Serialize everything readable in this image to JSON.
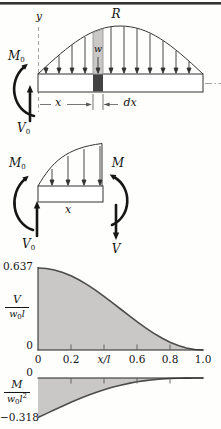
{
  "figure": {
    "top_diagram": {
      "axis_label": "y",
      "resultant_label": "R",
      "load_intensity_label": "w",
      "left_moment": {
        "base": "M",
        "sub": "0"
      },
      "left_shear": {
        "base": "V",
        "sub": "0"
      },
      "x_dim_label": "x",
      "dx_dim_label": "dx"
    },
    "fbd_diagram": {
      "left_moment": {
        "base": "M",
        "sub": "0"
      },
      "left_shear": {
        "base": "V",
        "sub": "0"
      },
      "right_moment": "M",
      "right_shear": "V",
      "x_dim_label": "x"
    }
  },
  "chart_data": [
    {
      "type": "area",
      "name": "shear",
      "title": "",
      "xlabel": "x/l",
      "ylabel": "V/w0l",
      "ylabel_frac": {
        "num": "V",
        "den_base": "w",
        "den_sub": "0",
        "den_rest": "l"
      },
      "y_top_label": "0.637",
      "y_zero_label": "0",
      "x_tick_labels": [
        "0",
        "0.2",
        "x/l",
        "0.6",
        "0.8",
        "1.0"
      ],
      "x_ticks": [
        0.2,
        0.4,
        0.6,
        0.8
      ],
      "xlim": [
        0,
        1
      ],
      "ylim": [
        0,
        0.6366
      ],
      "baseline": 0,
      "grid": false,
      "x": [
        0,
        0.05,
        0.1,
        0.15,
        0.2,
        0.25,
        0.3,
        0.35,
        0.4,
        0.45,
        0.5,
        0.55,
        0.6,
        0.65,
        0.7,
        0.75,
        0.8,
        0.85,
        0.9,
        0.95,
        1
      ],
      "values": [
        0.6366,
        0.6327,
        0.6211,
        0.602,
        0.5758,
        0.5434,
        0.5054,
        0.4628,
        0.4167,
        0.3681,
        0.3183,
        0.2685,
        0.22,
        0.1738,
        0.1312,
        0.0932,
        0.0608,
        0.0347,
        0.0156,
        0.0039,
        0
      ],
      "pixel_box": {
        "x0": 38,
        "x1": 203,
        "y0": 350,
        "y1": 268
      },
      "fill": "#c9c8c6",
      "stroke": "#4d4d4d"
    },
    {
      "type": "area",
      "name": "moment",
      "title": "",
      "xlabel": "x/l",
      "ylabel": "M/w0l2",
      "ylabel_frac": {
        "num": "M",
        "den_base": "w",
        "den_sub": "0",
        "den_rest": "l",
        "den_sup": "2"
      },
      "y_zero_label": "0",
      "y_bottom_label": "−0.318",
      "x_ticks": [
        0.2,
        0.4,
        0.6,
        0.8
      ],
      "xlim": [
        0,
        1
      ],
      "ylim": [
        -0.3183,
        0
      ],
      "baseline": 0,
      "grid": false,
      "x": [
        0,
        0.05,
        0.1,
        0.15,
        0.2,
        0.25,
        0.3,
        0.35,
        0.4,
        0.45,
        0.5,
        0.55,
        0.6,
        0.65,
        0.7,
        0.75,
        0.8,
        0.85,
        0.9,
        0.95,
        1
      ],
      "values": [
        -0.3183,
        -0.2866,
        -0.2552,
        -0.2246,
        -0.1951,
        -0.1671,
        -0.1409,
        -0.1168,
        -0.0947,
        -0.075,
        -0.0578,
        -0.0432,
        -0.031,
        -0.0213,
        -0.0135,
        -0.008,
        -0.0041,
        -0.0017,
        -0.0005,
        -0.0001,
        0
      ],
      "pixel_box": {
        "x0": 38,
        "x1": 203,
        "y0": 417.5,
        "y1": 378
      },
      "fill": "#c9c8c6",
      "stroke": "#4d4d4d"
    }
  ]
}
